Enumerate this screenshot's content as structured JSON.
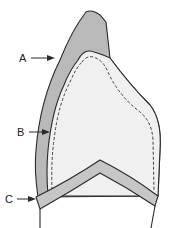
{
  "diagram": {
    "labels": [
      {
        "id": "A",
        "text": "A",
        "x": 19,
        "y": 62
      },
      {
        "id": "B",
        "text": "B",
        "x": 17,
        "y": 136
      },
      {
        "id": "C",
        "text": "C",
        "x": 5,
        "y": 203
      }
    ],
    "colors": {
      "outer_layer": "#b9b9b9",
      "inner_fill": "#f0f0f0",
      "band": "#c6c6c6",
      "stroke": "#2a2a2a"
    }
  }
}
